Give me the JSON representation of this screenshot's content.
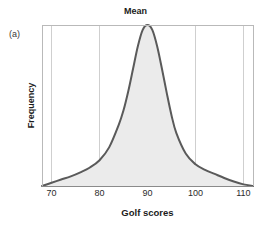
{
  "figure": {
    "panel_label": "(a)",
    "background_color": "#ffffff"
  },
  "chart_data": {
    "type": "area",
    "title": "Mean",
    "subtitle": "",
    "xlabel": "Golf scores",
    "ylabel": "Frequency",
    "xlim": [
      68,
      112
    ],
    "ylim": [
      0,
      1
    ],
    "xticks": [
      70,
      80,
      90,
      100,
      110
    ],
    "xtick_labels": [
      "70",
      "80",
      "90",
      "100",
      "110"
    ],
    "yticks": [],
    "ytick_labels": [],
    "grid": "vertical",
    "legend": "none",
    "annotations": [
      {
        "text": "Mean",
        "x": 90,
        "position": "top-center",
        "role": "title-marker"
      }
    ],
    "series": [
      {
        "name": "Golf score distribution",
        "kind": "density-curve",
        "line_color": "#5a5a5a",
        "fill_color": "#ebebeb",
        "line_width": 2,
        "mean": 90,
        "peak_x": 90,
        "peak_y": 1.0,
        "shape": "leptokurtic",
        "x": [
          68,
          70,
          72,
          74,
          76,
          78,
          80,
          82,
          84,
          85,
          86,
          87,
          88,
          89,
          90,
          91,
          92,
          93,
          94,
          95,
          96,
          98,
          100,
          102,
          104,
          106,
          108,
          110,
          112
        ],
        "values": [
          0.0,
          0.02,
          0.04,
          0.06,
          0.085,
          0.115,
          0.16,
          0.24,
          0.38,
          0.47,
          0.59,
          0.73,
          0.87,
          0.97,
          1.0,
          0.97,
          0.87,
          0.73,
          0.58,
          0.44,
          0.33,
          0.2,
          0.135,
          0.1,
          0.075,
          0.05,
          0.028,
          0.01,
          0.0
        ]
      }
    ],
    "plot_area_px": {
      "left": 42,
      "top": 25,
      "right": 253,
      "bottom": 186
    },
    "axis_color": "#b9b9b9",
    "grid_color": "#cfcfcf"
  }
}
